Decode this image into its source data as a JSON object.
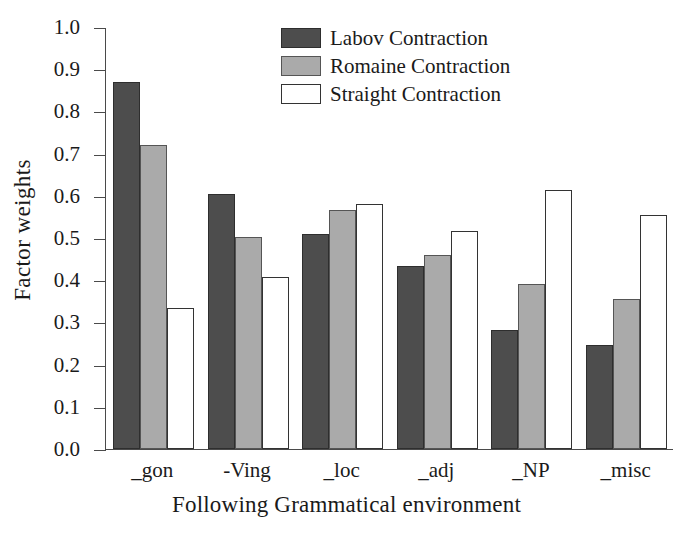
{
  "chart_data": {
    "type": "bar",
    "title": "",
    "xlabel": "Following Grammatical environment",
    "ylabel": "Factor weights",
    "categories": [
      "_gon",
      "-Ving",
      "_loc",
      "_adj",
      "_NP",
      "_misc"
    ],
    "series": [
      {
        "name": "Labov Contraction",
        "color": "#4d4d4d",
        "values": [
          0.872,
          0.605,
          0.51,
          0.435,
          0.283,
          0.247
        ]
      },
      {
        "name": "Romaine Contraction",
        "color": "#aaaaaa",
        "values": [
          0.721,
          0.503,
          0.568,
          0.461,
          0.393,
          0.356
        ]
      },
      {
        "name": "Straight Contraction",
        "color": "#ffffff",
        "values": [
          0.334,
          0.409,
          0.581,
          0.519,
          0.616,
          0.557
        ]
      }
    ],
    "ylim": [
      0.0,
      1.0
    ],
    "yticks": [
      "0.0",
      "0.1",
      "0.2",
      "0.3",
      "0.4",
      "0.5",
      "0.6",
      "0.7",
      "0.8",
      "0.9",
      "1.0"
    ],
    "ytick_values": [
      0.0,
      0.1,
      0.2,
      0.3,
      0.4,
      0.5,
      0.6,
      0.7,
      0.8,
      0.9,
      1.0
    ],
    "grid": false,
    "legend_position": "top-center"
  }
}
